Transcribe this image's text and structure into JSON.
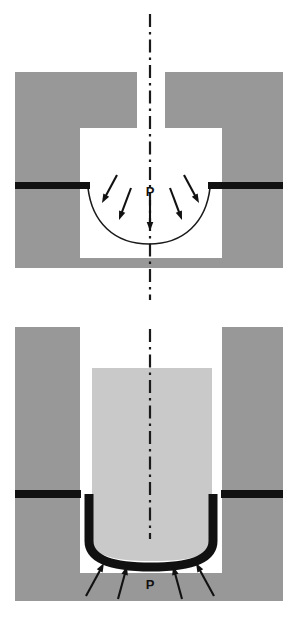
{
  "figure": {
    "width": 299,
    "height": 622,
    "background_color": "#ffffff"
  },
  "colors": {
    "die_gray": "#989898",
    "punch_gray": "#c9c9c9",
    "cavity_white": "#ffffff",
    "sheet_black": "#111111",
    "centerline_black": "#1a1a1a",
    "arrow_black": "#111111",
    "curve_black": "#1a1a1a"
  },
  "panels": [
    {
      "id": "top",
      "name": "free-bulge-forming-stage",
      "description": "Die block with open cavity; thin sheet deformed downward into a bowl by pressure applied from above",
      "die": {
        "name": "die-block",
        "fill": "#989898",
        "x": 15,
        "y": 72,
        "width": 268,
        "height": 196,
        "notch": {
          "name": "die-entry-notch",
          "x": 137,
          "y": 72,
          "width": 28,
          "height": 56
        },
        "cavity": {
          "name": "die-cavity",
          "fill": "#ffffff",
          "x": 80,
          "y": 128,
          "width": 142,
          "height": 130
        }
      },
      "sheet": {
        "name": "sheet-blank",
        "fill": "#111111",
        "thickness": 7,
        "left_flange": {
          "x": 15,
          "y": 182,
          "width": 75,
          "height": 7
        },
        "right_flange": {
          "x": 208,
          "y": 182,
          "width": 75,
          "height": 7
        }
      },
      "bulge_curve": {
        "name": "deformed-sheet-curve",
        "stroke": "#1a1a1a",
        "stroke_width": 1.6,
        "start_x": 88,
        "start_y": 188,
        "end_x": 210,
        "end_y": 188,
        "bottom_y": 244
      },
      "centerline": {
        "name": "axis-centerline",
        "x": 150,
        "top_y": 14,
        "bottom_y": 300,
        "stroke": "#1a1a1a",
        "stroke_width": 2.2,
        "pattern": "dash-dot"
      },
      "pressure_label": {
        "name": "pressure-label-p",
        "text": "P",
        "x": 150,
        "y": 196
      },
      "arrows": [
        {
          "name": "pressure-arrow-1",
          "x1": 117,
          "y1": 175,
          "x2": 102,
          "y2": 203
        },
        {
          "name": "pressure-arrow-2",
          "x1": 131,
          "y1": 188,
          "x2": 119,
          "y2": 220
        },
        {
          "name": "pressure-arrow-3",
          "x1": 150,
          "y1": 200,
          "x2": 150,
          "y2": 231
        },
        {
          "name": "pressure-arrow-4",
          "x1": 170,
          "y1": 188,
          "x2": 182,
          "y2": 220
        },
        {
          "name": "pressure-arrow-5",
          "x1": 184,
          "y1": 175,
          "x2": 199,
          "y2": 203
        }
      ]
    },
    {
      "id": "bottom",
      "name": "punch-draw-forming-stage",
      "description": "Punch descended into die forming a deep cup; pressure applied upward from beneath the formed cup",
      "die": {
        "name": "die-block-left",
        "fill": "#989898",
        "x": 15,
        "y": 16,
        "width": 65,
        "height": 274
      },
      "die_right": {
        "name": "die-block-right",
        "fill": "#989898",
        "x": 222,
        "y": 16,
        "width": 61,
        "height": 274
      },
      "die_base": {
        "name": "die-base-block",
        "fill": "#989898",
        "x": 15,
        "y": 262,
        "width": 268,
        "height": 28
      },
      "cavity": {
        "name": "die-cavity",
        "fill": "#ffffff",
        "x": 80,
        "y": 16,
        "width": 142,
        "height": 246
      },
      "punch": {
        "name": "punch-block",
        "fill": "#c9c9c9",
        "x": 92,
        "y": 57,
        "width": 120,
        "height": 164
      },
      "sheet": {
        "name": "formed-cup-sheet",
        "fill": "#111111",
        "stroke_width": 9,
        "left_flange": {
          "x": 15,
          "y": 179,
          "width": 66,
          "height": 8
        },
        "right_flange": {
          "x": 221,
          "y": 179,
          "width": 62,
          "height": 8
        },
        "wall_left_x": 89,
        "wall_right_x": 213,
        "wall_top_y": 183,
        "wall_bottom_y": 230,
        "cup_bottom_y": 250
      },
      "centerline": {
        "name": "axis-centerline",
        "x": 150,
        "top_y": 18,
        "bottom_y": 228,
        "stroke": "#1a1a1a",
        "stroke_width": 2.2,
        "pattern": "dash-dot"
      },
      "pressure_label": {
        "name": "pressure-label-p",
        "text": "P",
        "x": 150,
        "y": 278
      },
      "arrows": [
        {
          "name": "pressure-arrow-1",
          "x1": 86,
          "y1": 285,
          "x2": 104,
          "y2": 252
        },
        {
          "name": "pressure-arrow-2",
          "x1": 118,
          "y1": 288,
          "x2": 127,
          "y2": 255
        },
        {
          "name": "pressure-arrow-3",
          "x1": 182,
          "y1": 288,
          "x2": 173,
          "y2": 255
        },
        {
          "name": "pressure-arrow-4",
          "x1": 214,
          "y1": 285,
          "x2": 196,
          "y2": 252
        }
      ]
    }
  ]
}
